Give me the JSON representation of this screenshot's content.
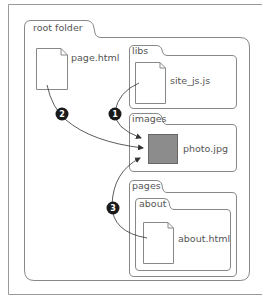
{
  "diagram": {
    "type": "folder-structure",
    "colors": {
      "line": "#888888",
      "text": "#555555",
      "badge": "#1a1a1a",
      "photo_fill": "#8c8c8c",
      "photo_border": "#666666"
    },
    "root_folder": {
      "label": "root folder",
      "files": [
        {
          "name": "page.html",
          "type": "document"
        }
      ],
      "subfolders": [
        {
          "label": "libs",
          "files": [
            {
              "name": "site_js.js",
              "type": "document"
            }
          ]
        },
        {
          "label": "images",
          "files": [
            {
              "name": "photo.jpg",
              "type": "image"
            }
          ]
        },
        {
          "label": "pages",
          "subfolders": [
            {
              "label": "about",
              "files": [
                {
                  "name": "about.html",
                  "type": "document"
                }
              ]
            }
          ]
        }
      ]
    },
    "references": [
      {
        "number": "1",
        "from": "site_js.js",
        "to": "photo.jpg"
      },
      {
        "number": "2",
        "from": "page.html",
        "to": "photo.jpg"
      },
      {
        "number": "3",
        "from": "about.html",
        "to": "photo.jpg"
      }
    ]
  }
}
